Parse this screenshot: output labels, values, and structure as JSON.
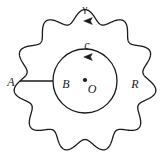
{
  "figure": {
    "background_color": "#ffffff",
    "stroke_color": "#1a1a1a",
    "labels": [
      {
        "id": "gamma",
        "text": "γ",
        "x": 85,
        "y": 8,
        "style": "greek",
        "meaning": "outer-contour-label"
      },
      {
        "id": "c",
        "text": "c",
        "x": 87,
        "y": 45,
        "style": "italic",
        "meaning": "inner-circle-label"
      },
      {
        "id": "A",
        "text": "A",
        "x": 11,
        "y": 82,
        "style": "italic",
        "meaning": "outer-cut-point-label"
      },
      {
        "id": "B",
        "text": "B",
        "x": 66,
        "y": 84,
        "style": "italic",
        "meaning": "inner-cut-point-label"
      },
      {
        "id": "O",
        "text": "O",
        "x": 92,
        "y": 89,
        "style": "italic",
        "meaning": "center-label"
      },
      {
        "id": "R",
        "text": "R",
        "x": 135,
        "y": 84,
        "style": "italic",
        "meaning": "region-label"
      }
    ],
    "center_point": {
      "x": 85,
      "y": 80,
      "radius": 2.1,
      "label": "O"
    },
    "inner_circle": {
      "cx": 85,
      "cy": 81,
      "r": 32,
      "orientation": "counterclockwise"
    },
    "outer_contour": {
      "cx": 85,
      "cy": 81,
      "mean_radius": 65,
      "amplitude": 6.5,
      "lobes": 11,
      "orientation": "counterclockwise"
    },
    "cut_line": {
      "x1": 20,
      "y1": 81,
      "x2": 53,
      "y2": 81,
      "from": "A",
      "to": "B"
    },
    "arrows": [
      {
        "id": "gamma-arrow",
        "x": 88,
        "y": 21,
        "direction": "left",
        "on": "outer_contour"
      },
      {
        "id": "c-arrow",
        "x": 88,
        "y": 57,
        "direction": "left",
        "on": "inner_circle"
      }
    ]
  }
}
